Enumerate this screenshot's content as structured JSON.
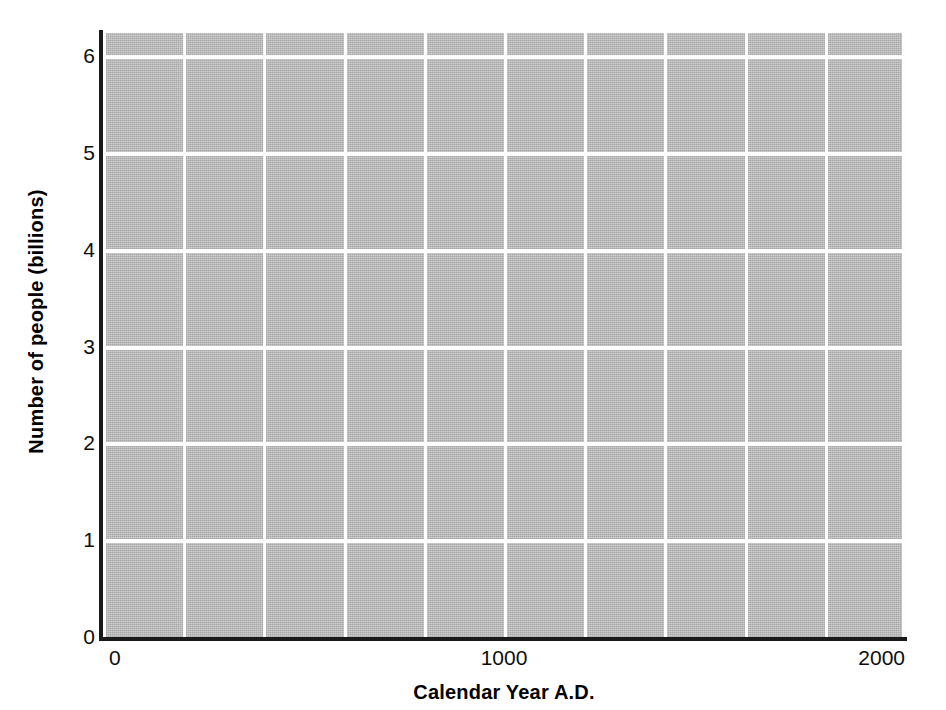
{
  "chart_data": {
    "type": "line",
    "title": "",
    "xlabel": "Calendar Year A.D.",
    "ylabel": "Number of people (billions)",
    "xlim": [
      0,
      2000
    ],
    "ylim": [
      0,
      6.25
    ],
    "grid": true,
    "legend": null,
    "series": [],
    "x": [],
    "values": [],
    "xticks": [
      {
        "value": 0,
        "label": "0"
      },
      {
        "value": 1000,
        "label": "1000"
      },
      {
        "value": 2000,
        "label": "2000"
      }
    ],
    "yticks": [
      {
        "value": 0,
        "label": "0"
      },
      {
        "value": 1,
        "label": "1"
      },
      {
        "value": 2,
        "label": "2"
      },
      {
        "value": 3,
        "label": "3"
      },
      {
        "value": 4,
        "label": "4"
      },
      {
        "value": 5,
        "label": "5"
      },
      {
        "value": 6,
        "label": "6"
      }
    ],
    "x_gridline_values": [
      0,
      200,
      400,
      600,
      800,
      1000,
      1200,
      1400,
      1600,
      1800,
      2000
    ],
    "y_gridline_values": [
      1,
      2,
      3,
      4,
      5,
      6
    ],
    "colors": {
      "plot_fill": "#b9b9b9",
      "gridline": "#fdfdfd",
      "axis_line": "#1a1a1a",
      "text": "#000000",
      "background": "#ffffff"
    },
    "note": "Blank gridded plot template with no plotted data series."
  }
}
